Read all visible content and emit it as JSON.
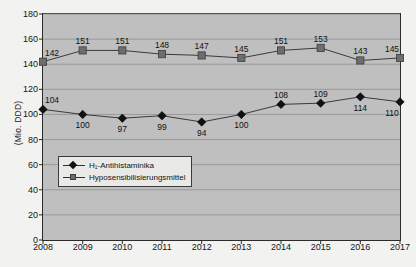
{
  "chart_data": {
    "type": "line",
    "title": "",
    "xlabel": "",
    "ylabel": "(Mio. DDD)",
    "ylim": [
      0,
      180
    ],
    "ytick_step": 20,
    "yticks": [
      "0",
      "20",
      "40",
      "60",
      "80",
      "100",
      "120",
      "140",
      "160",
      "180"
    ],
    "categories": [
      "2008",
      "2009",
      "2010",
      "2011",
      "2012",
      "2013",
      "2014",
      "2015",
      "2016",
      "2017"
    ],
    "grid": true,
    "legend_position": "inside-left",
    "series": [
      {
        "name": "H₁-Antihistaminika",
        "marker": "diamond",
        "color": "#111111",
        "values": [
          104,
          100,
          97,
          99,
          94,
          100,
          108,
          109,
          114,
          110
        ],
        "label_positions": [
          "above",
          "below",
          "below",
          "below",
          "below",
          "below",
          "above",
          "above",
          "below",
          "below"
        ]
      },
      {
        "name": "Hyposensibilisierungsmittel",
        "marker": "square",
        "color": "#6d6d6d",
        "values": [
          142,
          151,
          151,
          148,
          147,
          145,
          151,
          153,
          143,
          145
        ],
        "label_positions": [
          "above",
          "above",
          "above",
          "above",
          "above",
          "above",
          "above",
          "above",
          "above",
          "above"
        ]
      }
    ]
  },
  "colors": {
    "plot_background": "#bfbfbf",
    "page_background": "#f2f2f0",
    "axis": "#2b2b2b",
    "gridline": "#8f8f8f",
    "series_1": "#111111",
    "series_2": "#6d6d6d"
  }
}
